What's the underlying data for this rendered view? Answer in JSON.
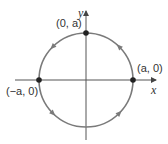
{
  "figure": {
    "axes": {
      "x_label": "x",
      "y_label": "y",
      "color": "#555555"
    },
    "circle": {
      "center_label": "origin",
      "radius_label": "a",
      "color": "#7a7a7a",
      "direction": "counterclockwise"
    },
    "points": [
      {
        "label": "(0, a)",
        "position": "top"
      },
      {
        "label": "(a, 0)",
        "position": "right"
      },
      {
        "label": "(−a, 0)",
        "position": "left"
      }
    ],
    "point_color": "#222222"
  }
}
